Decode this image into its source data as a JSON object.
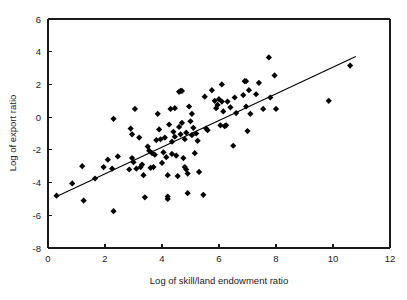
{
  "chart_data": {
    "type": "scatter",
    "title": "",
    "xlabel": "Log of skill/land endowment ratio",
    "ylabel": "Log of export ratio",
    "xlim": [
      0,
      12
    ],
    "ylim": [
      -8,
      6
    ],
    "xticks": [
      0,
      2,
      4,
      6,
      8,
      10,
      12
    ],
    "yticks": [
      -8,
      -6,
      -4,
      -2,
      0,
      2,
      4,
      6
    ],
    "xtick_labels": [
      "0",
      "2",
      "4",
      "6",
      "8",
      "10",
      "12"
    ],
    "ytick_labels": [
      "-8",
      "-6",
      "-4",
      "-2",
      "0",
      "2",
      "4",
      "6"
    ],
    "grid": false,
    "legend": false,
    "marker_style": "diamond",
    "marker_color": "#000000",
    "fit_line": {
      "label": "linear trend",
      "color": "#000000",
      "x_start": 0.3,
      "y_start": -4.85,
      "x_end": 10.8,
      "y_end": 3.7,
      "slope": 0.814,
      "intercept": -5.09
    },
    "points": [
      [
        0.3,
        -4.8
      ],
      [
        0.85,
        -4.05
      ],
      [
        1.2,
        -3.0
      ],
      [
        1.25,
        -5.1
      ],
      [
        1.65,
        -3.75
      ],
      [
        1.95,
        -3.05
      ],
      [
        2.1,
        -2.6
      ],
      [
        2.25,
        -3.15
      ],
      [
        2.3,
        -0.1
      ],
      [
        2.3,
        -5.75
      ],
      [
        2.45,
        -2.4
      ],
      [
        2.85,
        -3.2
      ],
      [
        2.9,
        -0.7
      ],
      [
        2.95,
        -1.05
      ],
      [
        2.95,
        -2.5
      ],
      [
        3.0,
        -2.75
      ],
      [
        3.05,
        0.5
      ],
      [
        3.1,
        -3.15
      ],
      [
        3.2,
        -1.25
      ],
      [
        3.25,
        -3.05
      ],
      [
        3.3,
        -2.9
      ],
      [
        3.35,
        -3.55
      ],
      [
        3.4,
        -4.9
      ],
      [
        3.5,
        -1.8
      ],
      [
        3.55,
        -2.05
      ],
      [
        3.6,
        -3.1
      ],
      [
        3.65,
        -2.2
      ],
      [
        3.7,
        -3.05
      ],
      [
        3.75,
        -2.3
      ],
      [
        3.8,
        -1.4
      ],
      [
        3.85,
        0.2
      ],
      [
        3.9,
        -0.75
      ],
      [
        3.95,
        -1.35
      ],
      [
        4.0,
        -2.8
      ],
      [
        4.05,
        -2.15
      ],
      [
        4.1,
        -1.25
      ],
      [
        4.15,
        -2.45
      ],
      [
        4.2,
        -3.55
      ],
      [
        4.2,
        -4.85
      ],
      [
        4.2,
        -5.0
      ],
      [
        4.25,
        -0.45
      ],
      [
        4.3,
        0.5
      ],
      [
        4.35,
        -1.5
      ],
      [
        4.35,
        -2.25
      ],
      [
        4.4,
        -0.9
      ],
      [
        4.45,
        0.55
      ],
      [
        4.45,
        -1.2
      ],
      [
        4.5,
        -2.35
      ],
      [
        4.55,
        -3.6
      ],
      [
        4.6,
        1.55
      ],
      [
        4.6,
        -0.6
      ],
      [
        4.65,
        1.6
      ],
      [
        4.65,
        -1.05
      ],
      [
        4.7,
        1.6
      ],
      [
        4.7,
        -0.35
      ],
      [
        4.75,
        -2.5
      ],
      [
        4.8,
        -3.05
      ],
      [
        4.8,
        -1.35
      ],
      [
        4.85,
        -3.2
      ],
      [
        4.85,
        -0.95
      ],
      [
        4.9,
        -4.65
      ],
      [
        4.9,
        -3.45
      ],
      [
        4.95,
        0.65
      ],
      [
        5.0,
        -0.25
      ],
      [
        5.05,
        0.2
      ],
      [
        5.05,
        -1.1
      ],
      [
        5.1,
        -0.65
      ],
      [
        5.15,
        -2.2
      ],
      [
        5.2,
        -1.0
      ],
      [
        5.25,
        -1.45
      ],
      [
        5.3,
        -3.35
      ],
      [
        5.45,
        -4.75
      ],
      [
        5.5,
        1.25
      ],
      [
        5.55,
        -0.7
      ],
      [
        5.6,
        -0.8
      ],
      [
        5.75,
        1.65
      ],
      [
        5.85,
        1.0
      ],
      [
        5.9,
        0.55
      ],
      [
        5.95,
        0.75
      ],
      [
        6.0,
        1.1
      ],
      [
        6.05,
        -0.5
      ],
      [
        6.1,
        2.0
      ],
      [
        6.1,
        0.95
      ],
      [
        6.15,
        0.35
      ],
      [
        6.2,
        -0.55
      ],
      [
        6.25,
        -0.5
      ],
      [
        6.3,
        0.95
      ],
      [
        6.4,
        0.6
      ],
      [
        6.5,
        -1.75
      ],
      [
        6.55,
        1.2
      ],
      [
        6.6,
        0.25
      ],
      [
        6.85,
        1.35
      ],
      [
        6.9,
        2.2
      ],
      [
        6.95,
        2.2
      ],
      [
        6.95,
        0.65
      ],
      [
        7.0,
        -0.85
      ],
      [
        7.05,
        1.65
      ],
      [
        7.1,
        0.2
      ],
      [
        7.3,
        1.4
      ],
      [
        7.4,
        2.1
      ],
      [
        7.55,
        0.5
      ],
      [
        7.75,
        3.65
      ],
      [
        7.8,
        1.2
      ],
      [
        7.95,
        2.55
      ],
      [
        8.0,
        0.5
      ],
      [
        9.85,
        1.0
      ],
      [
        10.6,
        3.15
      ]
    ]
  },
  "figure": {
    "width": 407,
    "height": 300,
    "background": "#ffffff"
  }
}
